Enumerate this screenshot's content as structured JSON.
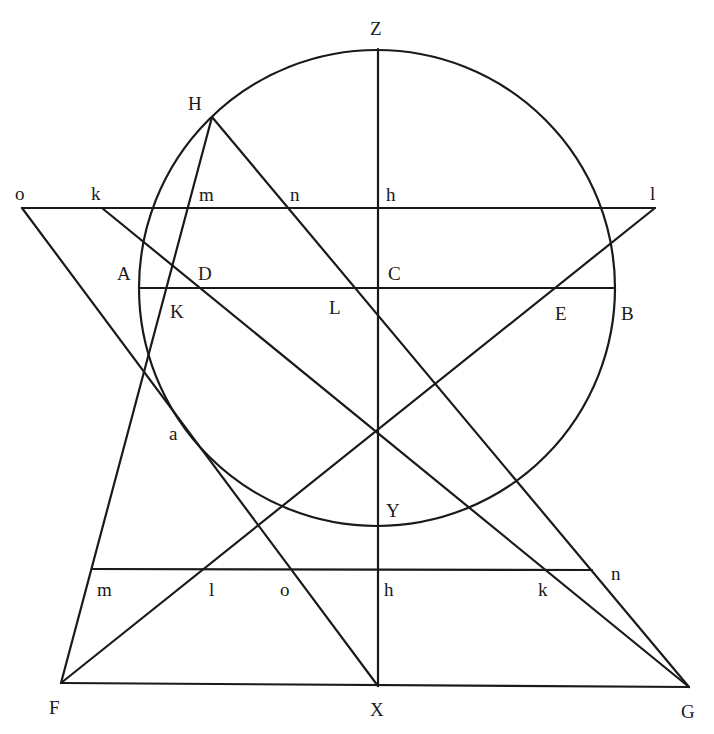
{
  "diagram": {
    "type": "geometric-construction",
    "stroke_color": "#1a1a1a",
    "background": "#ffffff",
    "circle": {
      "cx": 377,
      "cy": 288,
      "r": 238
    },
    "lines": [
      {
        "name": "line-o-l-upper-horizontal",
        "x1": 22,
        "y1": 208,
        "x2": 655,
        "y2": 208
      },
      {
        "name": "line-A-B-diameter",
        "x1": 139,
        "y1": 288,
        "x2": 615,
        "y2": 288
      },
      {
        "name": "line-Z-X-vertical",
        "x1": 378,
        "y1": 49,
        "x2": 378,
        "y2": 686
      },
      {
        "name": "line-m-n-lower-horizontal",
        "x1": 92,
        "y1": 569,
        "x2": 592,
        "y2": 570
      },
      {
        "name": "line-F-G-base",
        "x1": 61,
        "y1": 683,
        "x2": 689,
        "y2": 687
      },
      {
        "name": "line-H-F",
        "x1": 212,
        "y1": 117,
        "x2": 61,
        "y2": 683
      },
      {
        "name": "line-H-G",
        "x1": 212,
        "y1": 117,
        "x2": 689,
        "y2": 687
      },
      {
        "name": "line-k-G",
        "x1": 102,
        "y1": 208,
        "x2": 689,
        "y2": 687
      },
      {
        "name": "line-l-F",
        "x1": 655,
        "y1": 208,
        "x2": 61,
        "y2": 683
      },
      {
        "name": "line-o-X",
        "x1": 22,
        "y1": 208,
        "x2": 378,
        "y2": 686
      }
    ],
    "labels": [
      {
        "text": "Z",
        "x": 370,
        "y": 35
      },
      {
        "text": "H",
        "x": 188,
        "y": 110
      },
      {
        "text": "o",
        "x": 15,
        "y": 200
      },
      {
        "text": "k",
        "x": 91,
        "y": 200
      },
      {
        "text": "m",
        "x": 199,
        "y": 201
      },
      {
        "text": "n",
        "x": 290,
        "y": 201
      },
      {
        "text": "h",
        "x": 386,
        "y": 201
      },
      {
        "text": "l",
        "x": 650,
        "y": 200
      },
      {
        "text": "A",
        "x": 117,
        "y": 280
      },
      {
        "text": "D",
        "x": 198,
        "y": 280
      },
      {
        "text": "C",
        "x": 388,
        "y": 280
      },
      {
        "text": "K",
        "x": 170,
        "y": 318
      },
      {
        "text": "L",
        "x": 329,
        "y": 314
      },
      {
        "text": "E",
        "x": 555,
        "y": 320
      },
      {
        "text": "B",
        "x": 621,
        "y": 320
      },
      {
        "text": "a",
        "x": 169,
        "y": 440
      },
      {
        "text": "Y",
        "x": 386,
        "y": 517
      },
      {
        "text": "n",
        "x": 611,
        "y": 580
      },
      {
        "text": "m",
        "x": 97,
        "y": 596
      },
      {
        "text": "l",
        "x": 209,
        "y": 596
      },
      {
        "text": "o",
        "x": 280,
        "y": 596
      },
      {
        "text": "h",
        "x": 384,
        "y": 596
      },
      {
        "text": "k",
        "x": 538,
        "y": 596
      },
      {
        "text": "F",
        "x": 49,
        "y": 714
      },
      {
        "text": "X",
        "x": 370,
        "y": 716
      },
      {
        "text": "G",
        "x": 681,
        "y": 718
      }
    ]
  }
}
